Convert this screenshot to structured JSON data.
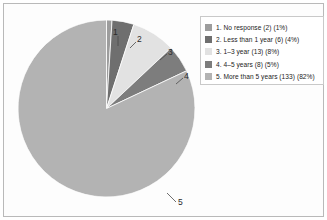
{
  "chart_data": {
    "type": "pie",
    "title": "",
    "legend_position": "right",
    "grid": false,
    "categories": [
      "1. No response",
      "2. Less than 1 year",
      "3. 1–3 year",
      "4. 4–5 years",
      "5. More than 5 years"
    ],
    "counts": [
      2,
      6,
      13,
      8,
      133
    ],
    "percents": [
      1,
      4,
      8,
      5,
      82
    ],
    "total": 162,
    "start_angle_deg": 0,
    "direction": "clockwise",
    "slice_colors": [
      "#9d9d9d",
      "#6f6f6f",
      "#e2e2e2",
      "#7d7d7d",
      "#b3b3b3"
    ],
    "legend_entries": [
      {
        "label": "1. No response (2) (1%)",
        "color": "#9d9d9d"
      },
      {
        "label": "2. Less than 1 year (6) (4%)",
        "color": "#6f6f6f"
      },
      {
        "label": "3. 1–3 year (13) (8%)",
        "color": "#e2e2e2"
      },
      {
        "label": "4. 4–5 years (8) (5%)",
        "color": "#7d7d7d"
      },
      {
        "label": "5. More than 5 years (133) (82%)",
        "color": "#b3b3b3"
      }
    ],
    "slice_callouts": [
      {
        "text": "1"
      },
      {
        "text": "2"
      },
      {
        "text": "3"
      },
      {
        "text": "4"
      },
      {
        "text": "5"
      }
    ]
  },
  "colors": {
    "frame_border": "#b9b9b9",
    "legend_border": "#c9c9c9",
    "leader_line": "#4a4a4a",
    "background": "#ffffff"
  }
}
